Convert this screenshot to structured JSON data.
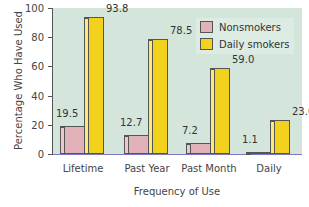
{
  "chart_data": {
    "type": "bar",
    "title": "",
    "xlabel": "Frequency of Use",
    "ylabel": "Percentage Who Have Used",
    "ylim": [
      0,
      100
    ],
    "yticks": [
      0,
      20,
      40,
      60,
      80,
      100
    ],
    "categories": [
      "Lifetime",
      "Past Year",
      "Past Month",
      "Daily"
    ],
    "series": [
      {
        "name": "Nonsmokers",
        "color": "#e2b2b9",
        "values": [
          19.5,
          12.7,
          7.2,
          1.1
        ]
      },
      {
        "name": "Daily smokers",
        "color": "#f3d21e",
        "values": [
          93.8,
          78.5,
          59.0,
          23.0
        ]
      }
    ],
    "value_labels": {
      "Nonsmokers": [
        "19.5",
        "12.7",
        "7.2",
        "1.1"
      ],
      "Daily smokers": [
        "93.8",
        "78.5",
        "59.0",
        "23.0"
      ]
    },
    "legend": {
      "position": "upper right",
      "entries": [
        "Nonsmokers",
        "Daily smokers"
      ]
    },
    "grid": false,
    "background": "#d4e6dc"
  },
  "axis": {
    "ticks": [
      "0",
      "20",
      "40",
      "60",
      "80",
      "100"
    ]
  }
}
